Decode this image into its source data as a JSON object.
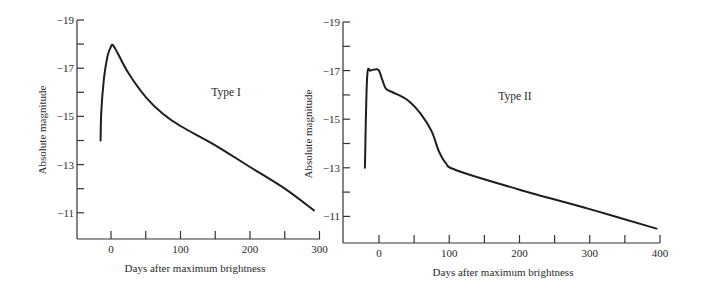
{
  "chart_data": [
    {
      "type": "line",
      "panel_label": "Type I",
      "xlabel": "Days after maximum brightness",
      "ylabel": "Absolute magnitude",
      "x_ticks": [
        0,
        100,
        200,
        300
      ],
      "x_tick_labels": [
        "0",
        "100",
        "200",
        "300"
      ],
      "x_minor_ticks": [
        0,
        50,
        100,
        150,
        200,
        250,
        300
      ],
      "y_ticks": [
        -19,
        -17,
        -15,
        -13,
        -11
      ],
      "y_tick_labels": [
        "−19",
        "−17",
        "−15",
        "−13",
        "−11"
      ],
      "y_minor_ticks": [
        -19,
        -18,
        -17,
        -16,
        -15,
        -14,
        -13,
        -12,
        -11
      ],
      "xlim": [
        -50,
        300
      ],
      "ylim": [
        -10,
        -19
      ],
      "y_inverted": true,
      "grid": false,
      "legend": null,
      "series": [
        {
          "name": "Type I",
          "x": [
            -15,
            -14,
            -10,
            -5,
            0,
            3,
            10,
            25,
            50,
            75,
            100,
            150,
            200,
            250,
            292
          ],
          "y": [
            -14.0,
            -15.2,
            -16.6,
            -17.5,
            -17.9,
            -17.95,
            -17.6,
            -16.8,
            -15.8,
            -15.1,
            -14.6,
            -13.8,
            -12.9,
            -12.0,
            -11.1
          ]
        }
      ]
    },
    {
      "type": "line",
      "panel_label": "Type II",
      "xlabel": "Days after maximum brightness",
      "ylabel": "Absolute magnitude",
      "x_ticks": [
        0,
        100,
        200,
        300,
        400
      ],
      "x_tick_labels": [
        "0",
        "100",
        "200",
        "300",
        "400"
      ],
      "x_minor_ticks": [
        0,
        50,
        100,
        150,
        200,
        250,
        300,
        350,
        400
      ],
      "y_ticks": [
        -19,
        -17,
        -15,
        -13,
        -11
      ],
      "y_tick_labels": [
        "−19",
        "−17",
        "−15",
        "−13",
        "−11"
      ],
      "y_minor_ticks": [
        -19,
        -18,
        -17,
        -16,
        -15,
        -14,
        -13,
        -12,
        -11
      ],
      "xlim": [
        -50,
        400
      ],
      "ylim": [
        -10,
        -19
      ],
      "y_inverted": true,
      "grid": false,
      "legend": null,
      "series": [
        {
          "name": "Type II",
          "x": [
            -20,
            -17,
            -12,
            -5,
            0,
            5,
            10,
            20,
            40,
            60,
            75,
            85,
            95,
            110,
            200,
            300,
            395
          ],
          "y": [
            -13.0,
            -16.7,
            -17.0,
            -17.05,
            -17.0,
            -16.6,
            -16.25,
            -16.1,
            -15.8,
            -15.2,
            -14.5,
            -13.7,
            -13.2,
            -12.9,
            -12.1,
            -11.3,
            -10.5
          ]
        }
      ]
    }
  ]
}
